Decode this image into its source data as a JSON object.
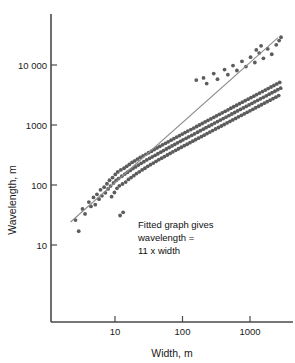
{
  "chart_data": {
    "type": "scatter",
    "title": "",
    "xlabel": "Width, m",
    "ylabel": "Wavelength, m",
    "xscale": "log",
    "yscale": "log",
    "xlim": [
      2.2,
      3000
    ],
    "ylim": [
      8,
      40000
    ],
    "grid": false,
    "legend": null,
    "xticks": [
      10,
      100,
      1000
    ],
    "xticklabels": [
      "10",
      "100",
      "1000"
    ],
    "yticks": [
      10,
      100,
      1000,
      10000
    ],
    "yticklabels": [
      "10",
      "100",
      "1000",
      "10 000"
    ],
    "annotation": {
      "line1": "Fitted graph gives",
      "line2": "wavelength =",
      "line3": "11 x width"
    },
    "fit": {
      "relation": "wavelength = 11 x width",
      "slope": 1,
      "factor": 11,
      "x_start": 2.2,
      "x_end": 2600
    },
    "marker": {
      "shape": "circle",
      "color": "#5c5c5c",
      "size": 1.9
    },
    "points": [
      [
        2.6,
        26
      ],
      [
        2.9,
        17
      ],
      [
        3.3,
        40
      ],
      [
        3.6,
        33
      ],
      [
        4.1,
        52
      ],
      [
        4.4,
        44
      ],
      [
        4.8,
        62
      ],
      [
        5.1,
        47
      ],
      [
        5.4,
        70
      ],
      [
        5.8,
        58
      ],
      [
        6.1,
        83
      ],
      [
        6.4,
        66
      ],
      [
        6.9,
        92
      ],
      [
        7.2,
        74
      ],
      [
        7.6,
        105
      ],
      [
        7.9,
        86
      ],
      [
        8.3,
        120
      ],
      [
        8.6,
        96
      ],
      [
        8.9,
        64
      ],
      [
        9.2,
        133
      ],
      [
        9.5,
        108
      ],
      [
        9.8,
        75
      ],
      [
        10.1,
        150
      ],
      [
        10.4,
        119
      ],
      [
        10.7,
        88
      ],
      [
        11.0,
        165
      ],
      [
        11.3,
        128
      ],
      [
        11.6,
        97
      ],
      [
        11.9,
        31
      ],
      [
        12.2,
        178
      ],
      [
        12.6,
        140
      ],
      [
        12.9,
        104
      ],
      [
        13.2,
        35
      ],
      [
        13.6,
        190
      ],
      [
        14.0,
        152
      ],
      [
        14.4,
        112
      ],
      [
        14.9,
        205
      ],
      [
        15.3,
        163
      ],
      [
        15.8,
        124
      ],
      [
        16.3,
        220
      ],
      [
        16.8,
        175
      ],
      [
        17.3,
        133
      ],
      [
        17.9,
        238
      ],
      [
        18.4,
        188
      ],
      [
        19.0,
        143
      ],
      [
        19.6,
        252
      ],
      [
        20.2,
        200
      ],
      [
        20.8,
        155
      ],
      [
        21.5,
        270
      ],
      [
        22.2,
        215
      ],
      [
        22.9,
        166
      ],
      [
        23.6,
        288
      ],
      [
        24.4,
        230
      ],
      [
        25.2,
        178
      ],
      [
        26.0,
        305
      ],
      [
        26.8,
        245
      ],
      [
        27.7,
        190
      ],
      [
        28.6,
        325
      ],
      [
        29.5,
        262
      ],
      [
        30.5,
        205
      ],
      [
        31.5,
        345
      ],
      [
        32.5,
        278
      ],
      [
        33.5,
        218
      ],
      [
        34.6,
        365
      ],
      [
        35.7,
        295
      ],
      [
        36.9,
        232
      ],
      [
        38.1,
        390
      ],
      [
        39.3,
        312
      ],
      [
        40.6,
        248
      ],
      [
        41.9,
        415
      ],
      [
        43.2,
        332
      ],
      [
        44.6,
        264
      ],
      [
        46.1,
        440
      ],
      [
        47.6,
        352
      ],
      [
        49.1,
        280
      ],
      [
        50.7,
        468
      ],
      [
        52.3,
        375
      ],
      [
        54.0,
        298
      ],
      [
        55.8,
        495
      ],
      [
        57.6,
        398
      ],
      [
        59.5,
        316
      ],
      [
        61.4,
        525
      ],
      [
        63.4,
        422
      ],
      [
        65.4,
        336
      ],
      [
        67.6,
        558
      ],
      [
        69.8,
        448
      ],
      [
        72.0,
        357
      ],
      [
        74.4,
        592
      ],
      [
        76.8,
        475
      ],
      [
        79.3,
        378
      ],
      [
        81.9,
        628
      ],
      [
        84.5,
        504
      ],
      [
        87.3,
        402
      ],
      [
        90.1,
        665
      ],
      [
        93.1,
        535
      ],
      [
        96.1,
        426
      ],
      [
        99.2,
        705
      ],
      [
        102,
        567
      ],
      [
        106,
        452
      ],
      [
        109,
        748
      ],
      [
        113,
        600
      ],
      [
        117,
        478
      ],
      [
        120,
        792
      ],
      [
        124,
        636
      ],
      [
        129,
        507
      ],
      [
        133,
        840
      ],
      [
        137,
        674
      ],
      [
        142,
        537
      ],
      [
        147,
        890
      ],
      [
        151,
        714
      ],
      [
        156,
        570
      ],
      [
        162,
        944
      ],
      [
        167,
        757
      ],
      [
        172,
        604
      ],
      [
        178,
        1000
      ],
      [
        184,
        803
      ],
      [
        190,
        640
      ],
      [
        196,
        1060
      ],
      [
        203,
        851
      ],
      [
        209,
        678
      ],
      [
        216,
        1124
      ],
      [
        223,
        902
      ],
      [
        231,
        719
      ],
      [
        238,
        1192
      ],
      [
        246,
        956
      ],
      [
        254,
        762
      ],
      [
        263,
        1263
      ],
      [
        271,
        1014
      ],
      [
        280,
        808
      ],
      [
        290,
        1340
      ],
      [
        299,
        1075
      ],
      [
        309,
        857
      ],
      [
        319,
        1420
      ],
      [
        330,
        1140
      ],
      [
        341,
        908
      ],
      [
        352,
        1505
      ],
      [
        364,
        1208
      ],
      [
        376,
        963
      ],
      [
        388,
        1595
      ],
      [
        401,
        1280
      ],
      [
        414,
        1020
      ],
      [
        428,
        1690
      ],
      [
        442,
        1357
      ],
      [
        457,
        1082
      ],
      [
        472,
        1792
      ],
      [
        488,
        1438
      ],
      [
        504,
        1147
      ],
      [
        520,
        1900
      ],
      [
        538,
        1525
      ],
      [
        555,
        1215
      ],
      [
        574,
        2014
      ],
      [
        593,
        1616
      ],
      [
        612,
        1288
      ],
      [
        633,
        2135
      ],
      [
        654,
        1713
      ],
      [
        675,
        1366
      ],
      [
        698,
        2263
      ],
      [
        721,
        1816
      ],
      [
        745,
        1448
      ],
      [
        770,
        2399
      ],
      [
        795,
        1925
      ],
      [
        822,
        1535
      ],
      [
        849,
        2543
      ],
      [
        877,
        2041
      ],
      [
        906,
        1627
      ],
      [
        936,
        2695
      ],
      [
        967,
        2163
      ],
      [
        999,
        1725
      ],
      [
        1032,
        2857
      ],
      [
        1066,
        2292
      ],
      [
        1102,
        1828
      ],
      [
        1138,
        3028
      ],
      [
        1176,
        2430
      ],
      [
        1215,
        1938
      ],
      [
        1255,
        3210
      ],
      [
        1297,
        2576
      ],
      [
        1340,
        2054
      ],
      [
        1384,
        3403
      ],
      [
        1430,
        2730
      ],
      [
        1477,
        2177
      ],
      [
        1527,
        3607
      ],
      [
        1577,
        2894
      ],
      [
        1630,
        2308
      ],
      [
        1684,
        3824
      ],
      [
        1740,
        3068
      ],
      [
        1798,
        2446
      ],
      [
        1858,
        4053
      ],
      [
        1920,
        3252
      ],
      [
        1983,
        2593
      ],
      [
        2050,
        4297
      ],
      [
        2118,
        3448
      ],
      [
        2189,
        2749
      ],
      [
        2261,
        4554
      ],
      [
        2337,
        3654
      ],
      [
        2415,
        2914
      ],
      [
        2496,
        4828
      ],
      [
        2578,
        3874
      ],
      [
        2665,
        3089
      ],
      [
        2754,
        5118
      ],
      [
        2845,
        4106
      ],
      [
        160,
        5600
      ],
      [
        205,
        6100
      ],
      [
        228,
        4900
      ],
      [
        290,
        7200
      ],
      [
        330,
        5800
      ],
      [
        420,
        8400
      ],
      [
        470,
        6900
      ],
      [
        560,
        9800
      ],
      [
        640,
        8100
      ],
      [
        760,
        11500
      ],
      [
        870,
        9400
      ],
      [
        1020,
        13500
      ],
      [
        1180,
        11000
      ],
      [
        1370,
        15800
      ],
      [
        1580,
        12900
      ],
      [
        1830,
        18500
      ],
      [
        2100,
        15100
      ],
      [
        2450,
        21700
      ],
      [
        1240,
        17800
      ],
      [
        1460,
        20900
      ],
      [
        2700,
        25500
      ],
      [
        2880,
        29000
      ]
    ]
  }
}
